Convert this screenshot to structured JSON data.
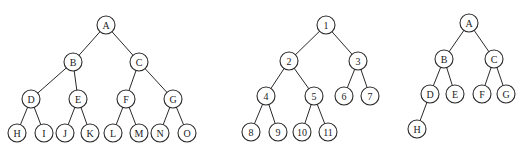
{
  "diagram": {
    "type": "binary-trees",
    "node_radius": 9,
    "colors": {
      "stroke": "#2a2a2a",
      "fill": "#ffffff",
      "text": "#222222",
      "background": "#ffffff"
    },
    "trees": [
      {
        "name": "full-binary-tree",
        "nodes": [
          {
            "id": "A",
            "label": "A",
            "x": 106,
            "y": 25
          },
          {
            "id": "B",
            "label": "B",
            "x": 73,
            "y": 62
          },
          {
            "id": "C",
            "label": "C",
            "x": 139,
            "y": 62
          },
          {
            "id": "D",
            "label": "D",
            "x": 31,
            "y": 99
          },
          {
            "id": "E",
            "label": "E",
            "x": 78,
            "y": 99
          },
          {
            "id": "F",
            "label": "F",
            "x": 126,
            "y": 99
          },
          {
            "id": "G",
            "label": "G",
            "x": 173,
            "y": 99
          },
          {
            "id": "H",
            "label": "H",
            "x": 17,
            "y": 133
          },
          {
            "id": "I",
            "label": "I",
            "x": 44,
            "y": 133
          },
          {
            "id": "J",
            "label": "J",
            "x": 65,
            "y": 133
          },
          {
            "id": "K",
            "label": "K",
            "x": 90,
            "y": 133
          },
          {
            "id": "L",
            "label": "L",
            "x": 113,
            "y": 133
          },
          {
            "id": "M",
            "label": "M",
            "x": 139,
            "y": 133
          },
          {
            "id": "N",
            "label": "N",
            "x": 160,
            "y": 133
          },
          {
            "id": "O",
            "label": "O",
            "x": 187,
            "y": 133
          }
        ],
        "edges": [
          [
            "A",
            "B"
          ],
          [
            "A",
            "C"
          ],
          [
            "B",
            "D"
          ],
          [
            "B",
            "E"
          ],
          [
            "C",
            "F"
          ],
          [
            "C",
            "G"
          ],
          [
            "D",
            "H"
          ],
          [
            "D",
            "I"
          ],
          [
            "E",
            "J"
          ],
          [
            "E",
            "K"
          ],
          [
            "F",
            "L"
          ],
          [
            "F",
            "M"
          ],
          [
            "G",
            "N"
          ],
          [
            "G",
            "O"
          ]
        ]
      },
      {
        "name": "complete-binary-tree",
        "nodes": [
          {
            "id": "1",
            "label": "1",
            "x": 326,
            "y": 25
          },
          {
            "id": "2",
            "label": "2",
            "x": 289,
            "y": 61
          },
          {
            "id": "3",
            "label": "3",
            "x": 358,
            "y": 61
          },
          {
            "id": "4",
            "label": "4",
            "x": 266,
            "y": 96
          },
          {
            "id": "5",
            "label": "5",
            "x": 314,
            "y": 96
          },
          {
            "id": "6",
            "label": "6",
            "x": 344,
            "y": 96
          },
          {
            "id": "7",
            "label": "7",
            "x": 370,
            "y": 96
          },
          {
            "id": "8",
            "label": "8",
            "x": 251,
            "y": 132
          },
          {
            "id": "9",
            "label": "9",
            "x": 278,
            "y": 132
          },
          {
            "id": "10",
            "label": "10",
            "x": 302,
            "y": 132
          },
          {
            "id": "11",
            "label": "11",
            "x": 328,
            "y": 132
          }
        ],
        "edges": [
          [
            "1",
            "2"
          ],
          [
            "1",
            "3"
          ],
          [
            "2",
            "4"
          ],
          [
            "2",
            "5"
          ],
          [
            "3",
            "6"
          ],
          [
            "3",
            "7"
          ],
          [
            "4",
            "8"
          ],
          [
            "4",
            "9"
          ],
          [
            "5",
            "10"
          ],
          [
            "5",
            "11"
          ]
        ]
      },
      {
        "name": "complete-binary-tree-letters",
        "nodes": [
          {
            "id": "A2",
            "label": "A",
            "x": 469,
            "y": 23
          },
          {
            "id": "B2",
            "label": "B",
            "x": 444,
            "y": 59
          },
          {
            "id": "C2",
            "label": "C",
            "x": 494,
            "y": 59
          },
          {
            "id": "D2",
            "label": "D",
            "x": 430,
            "y": 94
          },
          {
            "id": "E2",
            "label": "E",
            "x": 455,
            "y": 94
          },
          {
            "id": "F2",
            "label": "F",
            "x": 482,
            "y": 94
          },
          {
            "id": "G2",
            "label": "G",
            "x": 506,
            "y": 94
          },
          {
            "id": "H2",
            "label": "H",
            "x": 417,
            "y": 129
          }
        ],
        "edges": [
          [
            "A2",
            "B2"
          ],
          [
            "A2",
            "C2"
          ],
          [
            "B2",
            "D2"
          ],
          [
            "B2",
            "E2"
          ],
          [
            "C2",
            "F2"
          ],
          [
            "C2",
            "G2"
          ],
          [
            "D2",
            "H2"
          ]
        ]
      }
    ]
  }
}
